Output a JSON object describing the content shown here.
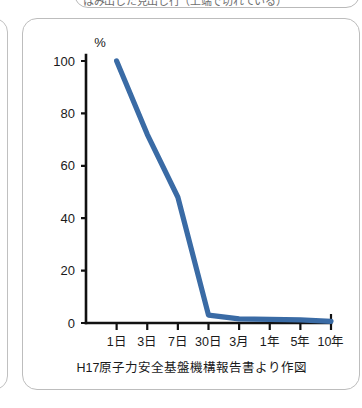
{
  "top_clipped_banner": {
    "text": "はみ出した見出し行（上端で切れている）"
  },
  "card": {
    "caption": "H17原子力安全基盤機構報告書より作図"
  },
  "chart_data": {
    "type": "line",
    "title": "",
    "subtitle": "",
    "xlabel": "",
    "ylabel": "",
    "unit_label": "%",
    "categories": [
      "1日",
      "3日",
      "7日",
      "30日",
      "3月",
      "1年",
      "5年",
      "10年"
    ],
    "series": [
      {
        "name": "残存割合",
        "color": "#3a6ba5",
        "values": [
          100,
          72,
          48,
          3,
          1.6,
          1.4,
          1.2,
          0.6
        ]
      }
    ],
    "ylim": [
      0,
      100
    ],
    "yticks": [
      0,
      20,
      40,
      60,
      80,
      100
    ],
    "ytick_labels": [
      "0",
      "20",
      "40",
      "60",
      "80",
      "100"
    ],
    "grid": false,
    "legend": false,
    "legend_position": "none"
  },
  "colors": {
    "line": "#3a6ba5",
    "axis": "#111111",
    "card_border": "#bdbdbd",
    "background": "#ffffff"
  }
}
